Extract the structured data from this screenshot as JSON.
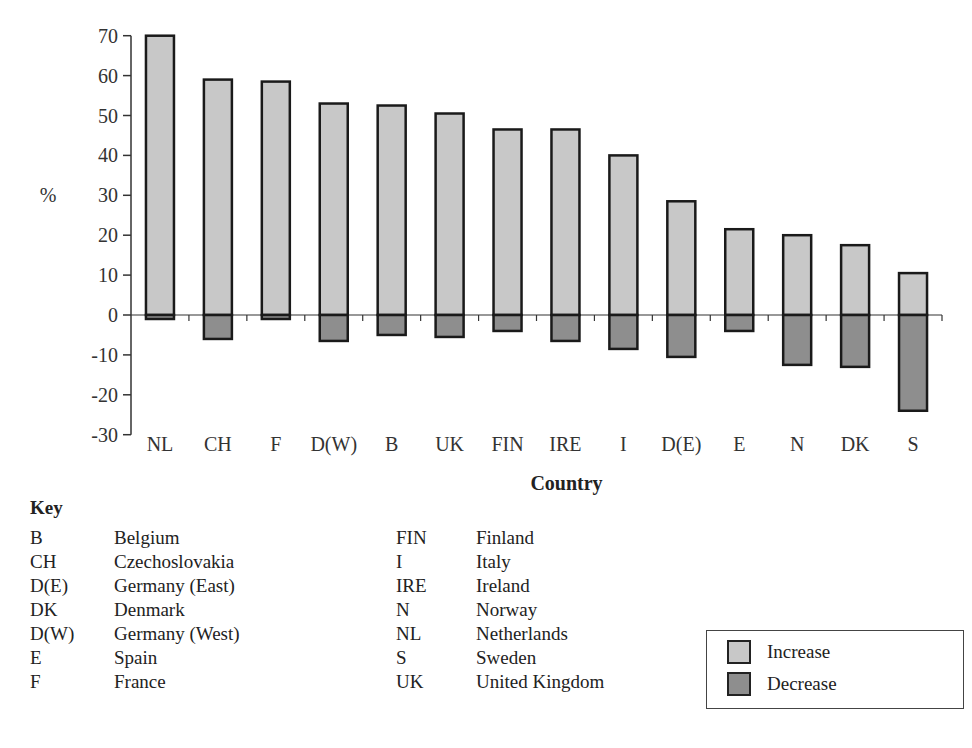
{
  "chart_data": {
    "type": "bar",
    "title": "",
    "xlabel": "Country",
    "ylabel": "%",
    "ylim": [
      -30,
      70
    ],
    "yticks": [
      70,
      60,
      50,
      40,
      30,
      20,
      10,
      0,
      -10,
      -20,
      -30
    ],
    "grid": false,
    "categories": [
      "NL",
      "CH",
      "F",
      "D(W)",
      "B",
      "UK",
      "FIN",
      "IRE",
      "I",
      "D(E)",
      "E",
      "N",
      "DK",
      "S"
    ],
    "series": [
      {
        "name": "Increase",
        "color": "#c8c8c8",
        "values": [
          70,
          59,
          58.5,
          53,
          52.5,
          50.5,
          46.5,
          46.5,
          40,
          28.5,
          21.5,
          20,
          17.5,
          10.5
        ]
      },
      {
        "name": "Decrease",
        "color": "#8e8e8e",
        "values": [
          -1,
          -6,
          -1,
          -6.5,
          -5,
          -5.5,
          -4,
          -6.5,
          -8.5,
          -10.5,
          -4,
          -12.5,
          -13,
          -24
        ]
      }
    ],
    "legend_position": "bottom-right"
  },
  "key": {
    "title": "Key",
    "left": [
      {
        "abbr": "B",
        "name": "Belgium"
      },
      {
        "abbr": "CH",
        "name": "Czechoslovakia"
      },
      {
        "abbr": "D(E)",
        "name": "Germany (East)"
      },
      {
        "abbr": "DK",
        "name": "Denmark"
      },
      {
        "abbr": "D(W)",
        "name": "Germany (West)"
      },
      {
        "abbr": "E",
        "name": "Spain"
      },
      {
        "abbr": "F",
        "name": "France"
      }
    ],
    "right": [
      {
        "abbr": "FIN",
        "name": "Finland"
      },
      {
        "abbr": "I",
        "name": "Italy"
      },
      {
        "abbr": "IRE",
        "name": "Ireland"
      },
      {
        "abbr": "N",
        "name": "Norway"
      },
      {
        "abbr": "NL",
        "name": "Netherlands"
      },
      {
        "abbr": "S",
        "name": "Sweden"
      },
      {
        "abbr": "UK",
        "name": "United Kingdom"
      }
    ]
  },
  "legend": {
    "increase_label": "Increase",
    "decrease_label": "Decrease"
  }
}
